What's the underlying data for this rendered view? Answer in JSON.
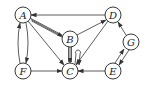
{
  "diagram": {
    "type": "directed-graph",
    "nodes": [
      {
        "id": "A",
        "label": "A",
        "x": 23,
        "y": 15
      },
      {
        "id": "B",
        "label": "B",
        "x": 70,
        "y": 39
      },
      {
        "id": "C",
        "label": "C",
        "x": 70,
        "y": 71
      },
      {
        "id": "D",
        "label": "D",
        "x": 113,
        "y": 15
      },
      {
        "id": "E",
        "label": "E",
        "x": 113,
        "y": 71
      },
      {
        "id": "F",
        "label": "F",
        "x": 23,
        "y": 71
      },
      {
        "id": "G",
        "label": "G",
        "x": 131,
        "y": 42
      }
    ],
    "edges": [
      {
        "from": "D",
        "to": "A",
        "style": "single"
      },
      {
        "from": "A",
        "to": "B",
        "style": "triple"
      },
      {
        "from": "B",
        "to": "D",
        "style": "single"
      },
      {
        "from": "A",
        "to": "C",
        "style": "single"
      },
      {
        "from": "A",
        "to": "F",
        "style": "curved"
      },
      {
        "from": "F",
        "to": "A",
        "style": "curved"
      },
      {
        "from": "F",
        "to": "C",
        "style": "single"
      },
      {
        "from": "B",
        "to": "C",
        "style": "double"
      },
      {
        "from": "C",
        "to": "C",
        "style": "self-loop"
      },
      {
        "from": "D",
        "to": "C",
        "style": "single"
      },
      {
        "from": "E",
        "to": "C",
        "style": "single"
      },
      {
        "from": "G",
        "to": "D",
        "style": "single"
      },
      {
        "from": "E",
        "to": "G",
        "style": "single"
      },
      {
        "from": "G",
        "to": "E",
        "style": "single"
      }
    ]
  }
}
